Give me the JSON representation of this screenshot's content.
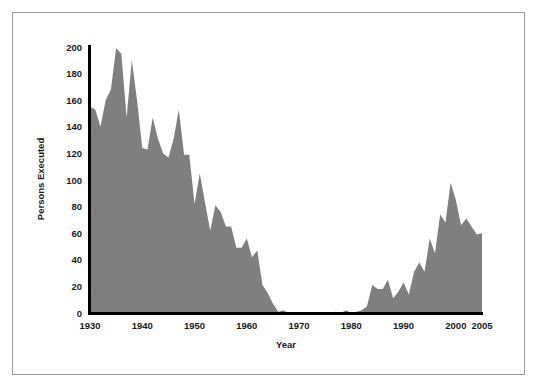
{
  "figure": {
    "border_color": "#9a9a9a",
    "background": "#ffffff"
  },
  "chart_data": {
    "type": "area",
    "title": "",
    "subtitle": "",
    "xlabel": "Year",
    "ylabel": "Persons Executed",
    "series_name": "Persons Executed",
    "fill_color": "#7f7f7f",
    "axis_color": "#000000",
    "grid": false,
    "legend": "none",
    "xlim": [
      1930,
      2005
    ],
    "ylim": [
      0,
      200
    ],
    "xticks": [
      1930,
      1940,
      1950,
      1960,
      1970,
      1980,
      1990,
      2000,
      2005
    ],
    "xtick_labels": [
      "1930",
      "1940",
      "1950",
      "1960",
      "1970",
      "1980",
      "1990",
      "2000",
      "2005"
    ],
    "yticks": [
      0,
      20,
      40,
      60,
      80,
      100,
      120,
      140,
      160,
      180,
      200
    ],
    "ytick_labels": [
      "0",
      "20",
      "40",
      "60",
      "80",
      "100",
      "120",
      "140",
      "160",
      "180",
      "200"
    ],
    "x": [
      1930,
      1931,
      1932,
      1933,
      1934,
      1935,
      1936,
      1937,
      1938,
      1939,
      1940,
      1941,
      1942,
      1943,
      1944,
      1945,
      1946,
      1947,
      1948,
      1949,
      1950,
      1951,
      1952,
      1953,
      1954,
      1955,
      1956,
      1957,
      1958,
      1959,
      1960,
      1961,
      1962,
      1963,
      1964,
      1965,
      1966,
      1967,
      1968,
      1969,
      1970,
      1971,
      1972,
      1973,
      1974,
      1975,
      1976,
      1977,
      1978,
      1979,
      1980,
      1981,
      1982,
      1983,
      1984,
      1985,
      1986,
      1987,
      1988,
      1989,
      1990,
      1991,
      1992,
      1993,
      1994,
      1995,
      1996,
      1997,
      1998,
      1999,
      2000,
      2001,
      2002,
      2003,
      2004,
      2005
    ],
    "values": [
      155,
      153,
      140,
      160,
      168,
      199,
      195,
      147,
      190,
      160,
      124,
      123,
      147,
      131,
      120,
      117,
      131,
      153,
      119,
      119,
      82,
      105,
      83,
      62,
      81,
      76,
      65,
      65,
      49,
      49,
      56,
      42,
      47,
      21,
      15,
      7,
      1,
      2,
      0,
      0,
      0,
      0,
      0,
      0,
      0,
      0,
      0,
      1,
      0,
      2,
      0,
      1,
      2,
      5,
      21,
      18,
      18,
      25,
      11,
      16,
      23,
      14,
      31,
      38,
      31,
      56,
      45,
      74,
      68,
      98,
      85,
      66,
      71,
      65,
      59,
      60
    ],
    "notable_points": [
      {
        "year": 1935,
        "value": 199,
        "note": "peak"
      },
      {
        "year": 1938,
        "value": 190
      },
      {
        "year": 1947,
        "value": 153
      },
      {
        "year": 1968,
        "value": 0,
        "note": "moratorium begins"
      },
      {
        "year": 1976,
        "value": 0,
        "note": "moratorium ends"
      },
      {
        "year": 1999,
        "value": 98,
        "note": "modern peak"
      },
      {
        "year": 2005,
        "value": 60
      }
    ]
  },
  "axes": {
    "y_axis_title": "Persons Executed",
    "x_axis_title": "Year"
  }
}
